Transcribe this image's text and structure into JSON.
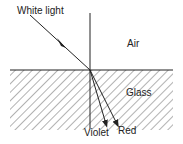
{
  "diagram": {
    "labels": {
      "incident": "White light",
      "upper_medium": "Air",
      "lower_medium": "Glass",
      "ray_violet": "Violet",
      "ray_red": "Red"
    },
    "colors": {
      "line": "#222222",
      "hatch": "#555555",
      "background": "#ffffff"
    }
  }
}
